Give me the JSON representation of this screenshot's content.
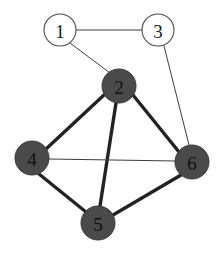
{
  "figure": {
    "kind": "undirected-graph-diagram",
    "background_color": "#ffffff",
    "width": 222,
    "height": 256
  },
  "style": {
    "filled_node_fill": "#4a4a4a",
    "filled_node_stroke": "#3a3a3a",
    "open_node_fill": "#ffffff",
    "open_node_stroke": "#4a4a4a",
    "thin_edge_color": "#3c3c3c",
    "thick_edge_color": "#232323",
    "thin_edge_width": 1,
    "thick_edge_width": 3.4,
    "label_color_on_dark": "#111111",
    "label_color_on_light": "#1a1a1a"
  },
  "graph": {
    "node_count": 6,
    "edge_count": 9,
    "nodes": [
      {
        "id": "1",
        "label": "1",
        "cx": 60,
        "cy": 30,
        "r": 16,
        "fill_style": "open"
      },
      {
        "id": "2",
        "label": "2",
        "cx": 119,
        "cy": 86,
        "r": 17,
        "fill_style": "filled"
      },
      {
        "id": "3",
        "label": "3",
        "cx": 158,
        "cy": 30,
        "r": 16,
        "fill_style": "open"
      },
      {
        "id": "4",
        "label": "4",
        "cx": 32,
        "cy": 158,
        "r": 17,
        "fill_style": "filled"
      },
      {
        "id": "5",
        "label": "5",
        "cx": 98,
        "cy": 223,
        "r": 17,
        "fill_style": "filled"
      },
      {
        "id": "6",
        "label": "6",
        "cx": 192,
        "cy": 162,
        "r": 17,
        "fill_style": "filled"
      }
    ],
    "edges": [
      {
        "source": "1",
        "target": "3",
        "weight_style": "thin",
        "x1": 76,
        "y1": 30,
        "x2": 142,
        "y2": 30
      },
      {
        "source": "1",
        "target": "2",
        "weight_style": "thin",
        "x1": 70,
        "y1": 43,
        "x2": 110,
        "y2": 73
      },
      {
        "source": "3",
        "target": "6",
        "weight_style": "thin",
        "x1": 164,
        "y1": 46,
        "x2": 189,
        "y2": 145
      },
      {
        "source": "2",
        "target": "4",
        "weight_style": "thick",
        "x1": 104,
        "y1": 95,
        "x2": 46,
        "y2": 149
      },
      {
        "source": "2",
        "target": "5",
        "weight_style": "thick",
        "x1": 116,
        "y1": 103,
        "x2": 100,
        "y2": 206
      },
      {
        "source": "2",
        "target": "6",
        "weight_style": "thick",
        "x1": 133,
        "y1": 95,
        "x2": 179,
        "y2": 152
      },
      {
        "source": "4",
        "target": "6",
        "weight_style": "thin",
        "x1": 49,
        "y1": 159,
        "x2": 175,
        "y2": 161
      },
      {
        "source": "4",
        "target": "5",
        "weight_style": "thick",
        "x1": 39,
        "y1": 174,
        "x2": 86,
        "y2": 212
      },
      {
        "source": "5",
        "target": "6",
        "weight_style": "thick",
        "x1": 113,
        "y1": 215,
        "x2": 181,
        "y2": 175
      }
    ]
  }
}
